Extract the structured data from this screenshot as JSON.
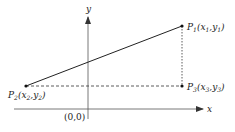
{
  "diagram": {
    "type": "coordinate-geometry",
    "axes": {
      "x_label": "x",
      "y_label": "y",
      "origin_label": "(0,0)"
    },
    "points": [
      {
        "id": "P1",
        "name": "P",
        "sub": "1",
        "coord_text": "(x",
        "x_sub": "1",
        "y_text": ",y",
        "y_sub": "1",
        "close": ")"
      },
      {
        "id": "P2",
        "name": "P",
        "sub": "2",
        "coord_text": "(x",
        "x_sub": "2",
        "y_text": ",y",
        "y_sub": "2",
        "close": ")"
      },
      {
        "id": "P3",
        "name": "P",
        "sub": "3",
        "coord_text": "(x",
        "x_sub": "3",
        "y_text": ",y",
        "y_sub": "3",
        "close": ")"
      }
    ],
    "segments": [
      {
        "from": "P2",
        "to": "P1",
        "style": "solid"
      },
      {
        "from": "P2",
        "to": "P3",
        "style": "dashed"
      },
      {
        "from": "P1",
        "to": "P3",
        "style": "dotted"
      }
    ],
    "colors": {
      "line": "#222222",
      "axis": "#555555",
      "background": "#ffffff"
    }
  }
}
